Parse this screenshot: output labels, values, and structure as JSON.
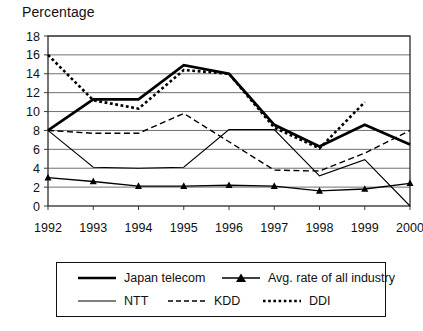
{
  "chart_data": {
    "type": "line",
    "title": "Percentage",
    "xlabel": "",
    "ylabel": "",
    "categories": [
      "1992",
      "1993",
      "1994",
      "1995",
      "1996",
      "1997",
      "1998",
      "1999",
      "2000"
    ],
    "x": [
      1992,
      1993,
      1994,
      1995,
      1996,
      1997,
      1998,
      1999,
      2000
    ],
    "ylim": [
      0,
      18
    ],
    "ytick_values": [
      0,
      2,
      4,
      6,
      8,
      10,
      12,
      14,
      16,
      18
    ],
    "ytick_labels": [
      "0",
      "2",
      "4",
      "6",
      "8",
      "10",
      "12",
      "14",
      "16",
      "18"
    ],
    "xlim": [
      1992,
      2000
    ],
    "grid": "horizontal",
    "legend_position": "bottom",
    "series": [
      {
        "name": "Japan telecom",
        "style": "thick-solid",
        "marker": "none",
        "color": "#000000",
        "values": [
          8.0,
          11.3,
          11.3,
          14.9,
          14.0,
          8.6,
          6.3,
          8.6,
          6.5
        ]
      },
      {
        "name": "Avg. rate of all industry",
        "style": "solid",
        "marker": "triangle",
        "color": "#000000",
        "values": [
          3.0,
          2.6,
          2.1,
          2.1,
          2.2,
          2.1,
          1.6,
          1.8,
          2.4
        ]
      },
      {
        "name": "NTT",
        "style": "thin-solid",
        "marker": "none",
        "color": "#000000",
        "values": [
          8.0,
          4.1,
          4.0,
          4.1,
          8.1,
          8.1,
          3.2,
          4.9,
          0.0
        ]
      },
      {
        "name": "KDD",
        "style": "dashed",
        "marker": "none",
        "color": "#000000",
        "values": [
          8.0,
          7.7,
          7.7,
          9.8,
          6.8,
          3.8,
          3.7,
          5.6,
          8.0
        ]
      },
      {
        "name": "DDI",
        "style": "dotted",
        "marker": "none",
        "color": "#000000",
        "values": [
          16.0,
          11.2,
          10.3,
          14.4,
          14.0,
          8.3,
          6.1,
          11.0,
          null
        ]
      }
    ]
  },
  "legend": {
    "items": [
      {
        "label": "Japan telecom",
        "style": "thick-solid",
        "marker": "none"
      },
      {
        "label": "Avg. rate of all industry",
        "style": "solid",
        "marker": "triangle"
      },
      {
        "label": "NTT",
        "style": "thin-solid",
        "marker": "none"
      },
      {
        "label": "KDD",
        "style": "dashed",
        "marker": "none"
      },
      {
        "label": "DDI",
        "style": "dotted",
        "marker": "none"
      }
    ]
  },
  "colors": {
    "ink": "#000000",
    "grid": "#6f6f6f",
    "frame": "#3a3a3a",
    "background": "#ffffff"
  }
}
